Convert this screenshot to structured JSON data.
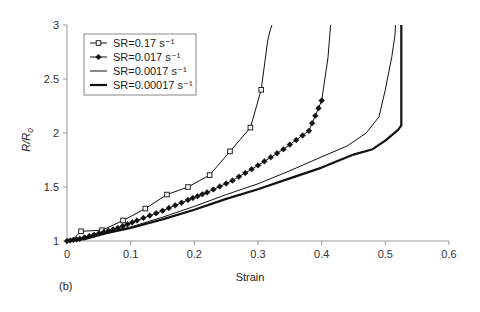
{
  "chart_data": {
    "type": "line",
    "title": "",
    "xlabel": "Strain",
    "ylabel": "R/R0",
    "ylabel_parts": {
      "main": "R/R",
      "sub": "0"
    },
    "xlim": [
      0,
      0.6
    ],
    "ylim": [
      1,
      3
    ],
    "xticks": [
      "0",
      "0.1",
      "0.2",
      "0.3",
      "0.4",
      "0.5",
      "0.6"
    ],
    "yticks": [
      "1",
      "1.5",
      "2",
      "2.5",
      "3"
    ],
    "grid": false,
    "legend_position": "upper-left",
    "panel_label": "(b)",
    "series": [
      {
        "name": "SR=0.17 s⁻¹",
        "marker": "square",
        "line_width": 1,
        "x": [
          0,
          0.01,
          0.022,
          0.055,
          0.088,
          0.123,
          157,
          0.19,
          0.224,
          0.256,
          0.288,
          0.305,
          0.315,
          0.319,
          0.322
        ],
        "y": [
          1.0,
          1.02,
          1.09,
          1.1,
          1.19,
          1.3,
          1.43,
          1.5,
          1.61,
          1.83,
          2.05,
          2.4,
          2.85,
          2.95,
          3.0
        ]
      },
      {
        "name": "SR=0.017 s⁻¹",
        "marker": "diamond",
        "line_width": 1,
        "x": [
          0,
          0.02,
          0.05,
          0.08,
          0.11,
          0.15,
          0.19,
          0.22,
          0.26,
          0.3,
          0.34,
          0.38,
          0.4,
          0.41,
          0.414
        ],
        "y": [
          1.0,
          1.02,
          1.07,
          1.12,
          1.19,
          1.28,
          1.38,
          1.45,
          1.56,
          1.7,
          1.85,
          2.02,
          2.3,
          2.7,
          3.0
        ]
      },
      {
        "name": "SR=0.0017 s⁻¹",
        "marker": "none",
        "line_width": 1,
        "x": [
          0,
          0.03,
          0.06,
          0.1,
          0.15,
          0.2,
          0.25,
          0.3,
          0.35,
          0.4,
          0.44,
          0.47,
          0.49,
          0.5,
          0.51,
          0.515,
          0.516
        ],
        "y": [
          1.0,
          1.03,
          1.08,
          1.13,
          1.22,
          1.32,
          1.43,
          1.53,
          1.65,
          1.78,
          1.88,
          2.0,
          2.15,
          2.4,
          2.7,
          2.9,
          3.0
        ]
      },
      {
        "name": "SR=0.00017 s⁻¹",
        "marker": "none",
        "line_width": 2.2,
        "x": [
          0,
          0.03,
          0.06,
          0.1,
          0.15,
          0.2,
          0.25,
          0.3,
          0.35,
          0.4,
          0.45,
          0.48,
          0.5,
          0.52,
          0.525,
          0.525
        ],
        "y": [
          1.0,
          1.02,
          1.07,
          1.12,
          1.2,
          1.29,
          1.39,
          1.48,
          1.58,
          1.68,
          1.8,
          1.85,
          1.93,
          2.03,
          2.07,
          3.0
        ]
      }
    ]
  }
}
